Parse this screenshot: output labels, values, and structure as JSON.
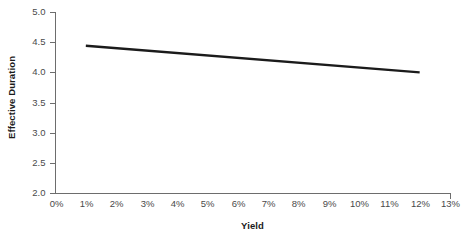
{
  "chart_data": {
    "type": "line",
    "title": "",
    "xlabel": "Yield",
    "ylabel": "Effective Duration",
    "xlim": [
      0,
      13
    ],
    "ylim": [
      2.0,
      5.0
    ],
    "grid": false,
    "legend": "none",
    "x_tick_labels": [
      "0%",
      "1%",
      "2%",
      "3%",
      "4%",
      "5%",
      "6%",
      "7%",
      "8%",
      "9%",
      "10%",
      "11%",
      "12%",
      "13%"
    ],
    "x_tick_values": [
      0,
      1,
      2,
      3,
      4,
      5,
      6,
      7,
      8,
      9,
      10,
      11,
      12,
      13
    ],
    "y_tick_labels": [
      "2.0",
      "2.5",
      "3.0",
      "3.5",
      "4.0",
      "4.5",
      "5.0"
    ],
    "y_tick_values": [
      2.0,
      2.5,
      3.0,
      3.5,
      4.0,
      4.5,
      5.0
    ],
    "series": [
      {
        "name": "Effective Duration",
        "color": "#1b1b1b",
        "x": [
          1,
          12
        ],
        "values": [
          4.44,
          4.0
        ]
      }
    ]
  },
  "axis_labels": {
    "x": "Yield",
    "y": "Effective Duration"
  },
  "colors": {
    "line": "#1b1b1b",
    "axis": "#6d6d6d",
    "tick_text": "#4a4a4a",
    "label_text": "#1b1b1b",
    "background": "#ffffff"
  }
}
